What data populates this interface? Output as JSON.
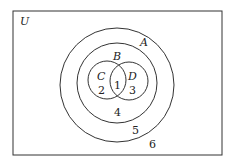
{
  "diagram": {
    "type": "venn",
    "universe_label": "U",
    "sets": [
      {
        "name": "A",
        "label": "A"
      },
      {
        "name": "B",
        "label": "B"
      },
      {
        "name": "C",
        "label": "C"
      },
      {
        "name": "D",
        "label": "D"
      }
    ],
    "regions": [
      {
        "id": "1",
        "label": "1",
        "description": "C ∩ D"
      },
      {
        "id": "2",
        "label": "2",
        "description": "C only"
      },
      {
        "id": "3",
        "label": "3",
        "description": "D only"
      },
      {
        "id": "4",
        "label": "4",
        "description": "B outside C and D"
      },
      {
        "id": "5",
        "label": "5",
        "description": "A outside B"
      },
      {
        "id": "6",
        "label": "6",
        "description": "U outside A"
      }
    ],
    "colors": {
      "stroke": "#333333",
      "background": "#ffffff"
    }
  }
}
